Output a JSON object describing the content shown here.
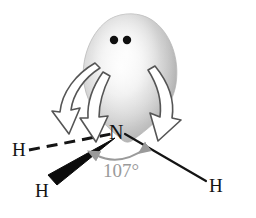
{
  "figure": {
    "type": "chemical-structure-diagram",
    "molecule": "NH3",
    "background_color": "#ffffff"
  },
  "atoms": {
    "central": {
      "symbol": "N",
      "name": "nitrogen",
      "color": "#141414"
    },
    "hydrogens": [
      {
        "symbol": "H",
        "position": "left",
        "bond_style": "dashed",
        "color": "#141414"
      },
      {
        "symbol": "H",
        "position": "bottom-left",
        "bond_style": "wedge",
        "color": "#141414"
      },
      {
        "symbol": "H",
        "position": "right",
        "bond_style": "plain",
        "color": "#141414"
      }
    ]
  },
  "lone_pair": {
    "shape": "teardrop-lobe",
    "electron_dots": 2,
    "dot_color": "#101010",
    "fill_light": "#fbfbfb",
    "fill_mid": "#c9c9c9",
    "fill_dark": "#9a9a9a"
  },
  "angle": {
    "value_label": "107°",
    "arc_color": "#9a9a9a",
    "text_color": "#9a9a9a"
  },
  "repulsion_arrows": {
    "count": 3,
    "style": "hollow-outlined-curved",
    "stroke_color": "#5a5a5a",
    "fill_color": "#ffffff"
  }
}
